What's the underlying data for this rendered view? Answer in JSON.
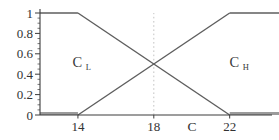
{
  "chart_data": {
    "type": "line",
    "xlabel": "C",
    "ylabel": "",
    "xlim": [
      12,
      24.6
    ],
    "ylim": [
      0,
      1
    ],
    "x_ticks": [
      14,
      18,
      22
    ],
    "y_ticks": [
      0,
      0.2,
      0.4,
      0.6,
      0.8,
      1
    ],
    "y_tick_labels": [
      "0",
      "0.2",
      "0.4",
      "0.6",
      "0.8",
      "1"
    ],
    "y_minor_tick_step": 0.05,
    "grid": false,
    "legend": "none",
    "guide_line": {
      "x": 18,
      "style": "dotted"
    },
    "crossover_point": {
      "x": 18,
      "y": 0.5
    },
    "series": [
      {
        "name": "CL",
        "label_main": "C",
        "label_sub": "L",
        "points": [
          [
            12,
            1
          ],
          [
            14,
            1
          ],
          [
            22,
            0
          ],
          [
            24.6,
            0
          ]
        ],
        "label_pos": [
          14.2,
          0.52
        ]
      },
      {
        "name": "CH",
        "label_main": "C",
        "label_sub": "H",
        "points": [
          [
            12,
            0
          ],
          [
            14,
            0
          ],
          [
            22,
            1
          ],
          [
            24.6,
            1
          ]
        ],
        "label_pos": [
          22.5,
          0.52
        ]
      }
    ],
    "colors": {
      "line": "#5e5e5e",
      "zero_flat": "#9b9b9b",
      "axis": "#3c3c3c",
      "guide": "#c4c4c4",
      "text": "#333333"
    }
  }
}
